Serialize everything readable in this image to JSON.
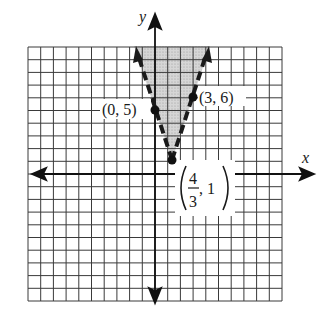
{
  "chart_data": {
    "type": "line",
    "title": "",
    "xlabel": "x",
    "ylabel": "y",
    "grid": true,
    "xlim": [
      -10,
      10
    ],
    "ylim": [
      -10,
      10
    ],
    "grid_spacing": 1,
    "region": {
      "description": "Shaded region above both dashed boundary lines (between the two rays of the V)",
      "boundaries": [
        {
          "name": "left boundary",
          "equation": "y = -3x + 5",
          "style": "dashed",
          "from": [
            1.3333,
            1
          ],
          "through": [
            0,
            5
          ]
        },
        {
          "name": "right boundary",
          "equation": "y = 3x - 3",
          "style": "dashed",
          "from": [
            1.3333,
            1
          ],
          "through": [
            3,
            6
          ]
        }
      ],
      "fill": "#c8c8c8"
    },
    "points": [
      {
        "label": "(0, 5)",
        "x": 0,
        "y": 5
      },
      {
        "label": "(3, 6)",
        "x": 3,
        "y": 6
      },
      {
        "label_num": "4",
        "label_den": "3",
        "label_y": "1",
        "x": 1.3333,
        "y": 1
      }
    ]
  },
  "labels": {
    "x_axis": "x",
    "y_axis": "y",
    "point_0_5": "(0, 5)",
    "point_3_6": "(3, 6)",
    "vertex_num": "4",
    "vertex_den": "3",
    "vertex_y": ", 1"
  },
  "colors": {
    "grid": "#3a3a3a",
    "axis": "#111111",
    "shade": "#cfcfcf",
    "line": "#1a1a1a"
  }
}
